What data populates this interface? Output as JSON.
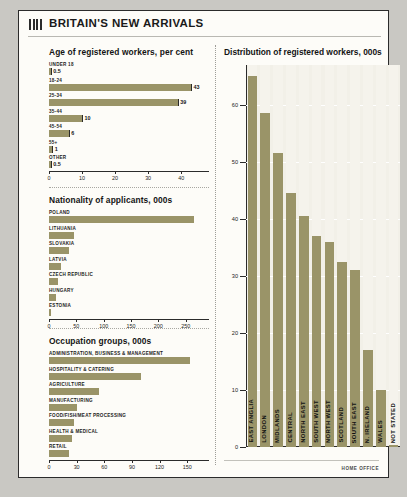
{
  "header": {
    "title": "BRITAIN'S NEW ARRIVALS",
    "icon": "bar-chart-icon"
  },
  "source": "HOME OFFICE",
  "colors": {
    "bar": "#9a9468",
    "card_bg": "#fdfcf8",
    "plot_bg": "#f2f0e8",
    "ink": "#1a1a1a"
  },
  "chart_data": [
    {
      "id": "age",
      "type": "bar",
      "orientation": "horizontal",
      "title": "Age of registered workers, per cent",
      "categories": [
        "UNDER 18",
        "18-24",
        "25-34",
        "35-44",
        "45-54",
        "55+",
        "OTHER"
      ],
      "values": [
        0.5,
        43,
        39,
        10,
        6,
        1,
        0.5
      ],
      "labels": [
        "0.5",
        "43",
        "39",
        "10",
        "6",
        "1",
        "0.5"
      ],
      "xlabel": "",
      "ylabel": "",
      "xlim": [
        0,
        46
      ],
      "xticks": [
        0,
        10,
        20,
        30,
        40
      ],
      "grid": false
    },
    {
      "id": "nationality",
      "type": "bar",
      "orientation": "horizontal",
      "title": "Nationality of applicants, 000s",
      "categories": [
        "POLAND",
        "LITHUANIA",
        "SLOVAKIA",
        "LATVIA",
        "CZECH REPUBLIC",
        "HUNGARY",
        "ESTONIA"
      ],
      "values": [
        265,
        45,
        37,
        22,
        17,
        12,
        3
      ],
      "xlabel": "",
      "ylabel": "",
      "xlim": [
        0,
        278
      ],
      "xticks": [
        0,
        50,
        100,
        150,
        200,
        250
      ],
      "grid": false
    },
    {
      "id": "occupation",
      "type": "bar",
      "orientation": "horizontal",
      "title": "Occupation groups, 000s",
      "categories": [
        "ADMINISTRATION, BUSINESS & MANAGEMENT",
        "HOSPITALITY & CATERING",
        "AGRICULTURE",
        "MANUFACTURING",
        "FOOD/FISH/MEAT PROCESSING",
        "HEALTH & MEDICAL",
        "RETAIL"
      ],
      "values": [
        153,
        100,
        54,
        30,
        27,
        25,
        22
      ],
      "xlabel": "",
      "ylabel": "",
      "xlim": [
        0,
        165
      ],
      "xticks": [
        0,
        30,
        60,
        90,
        120,
        150
      ],
      "grid": false
    },
    {
      "id": "distribution",
      "type": "bar",
      "orientation": "vertical",
      "title": "Distribution of registered workers, 000s",
      "categories": [
        "EAST ANGLIA",
        "LONDON",
        "MIDLANDS",
        "CENTRAL",
        "NORTH EAST",
        "SOUTH WEST",
        "NORTH WEST",
        "SCOTLAND",
        "SOUTH EAST",
        "N. IRELAND",
        "WALES",
        "NOT STATED"
      ],
      "values": [
        65,
        58.5,
        51.5,
        44.5,
        40.5,
        37,
        36,
        32.5,
        31,
        17,
        10,
        0.4
      ],
      "xlabel": "",
      "ylabel": "",
      "ylim": [
        0,
        67
      ],
      "yticks": [
        0,
        10,
        20,
        30,
        40,
        50,
        60
      ],
      "grid": true,
      "legend": "none"
    }
  ]
}
